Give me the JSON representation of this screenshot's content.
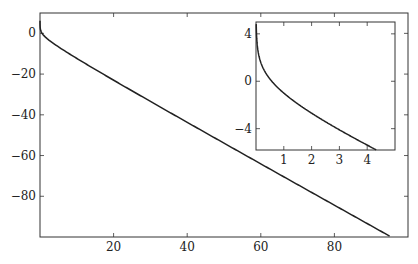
{
  "chart_data": [
    {
      "name": "main",
      "type": "line",
      "title": "",
      "xlabel": "",
      "ylabel": "",
      "function": "y = -x - ln(x)",
      "xlim": [
        0,
        100
      ],
      "ylim": [
        -100,
        10
      ],
      "xticks": [
        20,
        40,
        60,
        80
      ],
      "yticks": [
        0,
        -20,
        -40,
        -60,
        -80
      ],
      "xtick_labels": [
        "20",
        "40",
        "60",
        "80"
      ],
      "ytick_labels": [
        "0",
        "−20",
        "−40",
        "−60",
        "−80"
      ],
      "series": [
        {
          "name": "curve",
          "x": [
            0.002,
            0.01,
            0.05,
            0.2,
            0.5,
            1,
            2,
            5,
            10,
            20,
            30,
            40,
            50,
            60,
            70,
            80,
            90,
            95
          ],
          "values": [
            6.21,
            4.6,
            2.95,
            1.41,
            0.19,
            -1.0,
            -2.69,
            -6.61,
            -12.3,
            -23.0,
            -33.4,
            -43.7,
            -53.9,
            -64.1,
            -74.2,
            -84.4,
            -94.5,
            -99.55
          ]
        }
      ],
      "grid": false
    },
    {
      "name": "inset",
      "type": "line",
      "title": "",
      "xlabel": "",
      "ylabel": "",
      "function": "y = -x - ln(x)",
      "xlim": [
        0,
        5
      ],
      "ylim": [
        -5.8,
        5
      ],
      "xticks": [
        1,
        2,
        3,
        4
      ],
      "yticks": [
        4,
        0,
        -4
      ],
      "xtick_labels": [
        "1",
        "2",
        "3",
        "4"
      ],
      "ytick_labels": [
        "4",
        "0",
        "−4"
      ],
      "series": [
        {
          "name": "curve",
          "x": [
            0.008,
            0.02,
            0.05,
            0.1,
            0.2,
            0.5,
            1,
            1.5,
            2,
            2.5,
            3,
            3.5,
            4,
            4.5
          ],
          "values": [
            4.82,
            3.89,
            2.95,
            2.2,
            1.41,
            0.19,
            -1.0,
            -1.91,
            -2.69,
            -3.42,
            -4.1,
            -4.75,
            -5.39,
            -6.0
          ]
        }
      ],
      "grid": false
    }
  ]
}
